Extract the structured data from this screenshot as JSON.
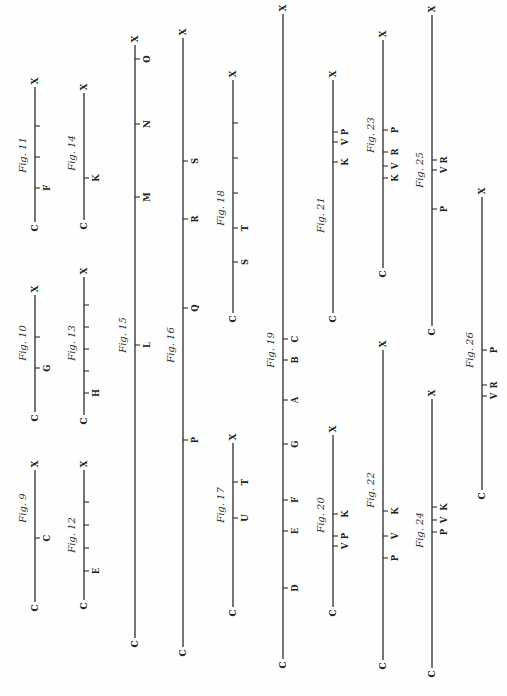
{
  "page": {
    "width": 507,
    "height": 696,
    "background": "#fefefe",
    "ink": "#2a2a2a",
    "orientation": "rotated 90° counter-clockwise; each figure is a line from C (bottom) to X (top)"
  },
  "figures": [
    {
      "id": "fig9",
      "caption": "Fig. 9",
      "x": 35,
      "top": 470,
      "bottom": 602,
      "start": "C",
      "end": "X",
      "caption_y": 508,
      "ticks": [
        {
          "y": 538,
          "label": "C"
        }
      ]
    },
    {
      "id": "fig10",
      "caption": "Fig. 10",
      "x": 35,
      "top": 295,
      "bottom": 412,
      "start": "C",
      "end": "X",
      "caption_y": 343,
      "ticks": [
        {
          "y": 337,
          "label": ""
        },
        {
          "y": 368,
          "label": "G"
        }
      ]
    },
    {
      "id": "fig11",
      "caption": "Fig. 11",
      "x": 35,
      "top": 87,
      "bottom": 222,
      "start": "C",
      "end": "X",
      "caption_y": 155,
      "ticks": [
        {
          "y": 126,
          "label": ""
        },
        {
          "y": 157,
          "label": ""
        },
        {
          "y": 188,
          "label": "F"
        }
      ]
    },
    {
      "id": "fig12",
      "caption": "Fig. 12",
      "x": 84,
      "top": 470,
      "bottom": 600,
      "start": "C",
      "end": "X",
      "caption_y": 535,
      "ticks": [
        {
          "y": 502,
          "label": ""
        },
        {
          "y": 525,
          "label": ""
        },
        {
          "y": 548,
          "label": ""
        },
        {
          "y": 571,
          "label": "E"
        }
      ]
    },
    {
      "id": "fig13",
      "caption": "Fig. 13",
      "x": 84,
      "top": 277,
      "bottom": 415,
      "start": "C",
      "end": "X",
      "caption_y": 343,
      "ticks": [
        {
          "y": 305,
          "label": ""
        },
        {
          "y": 327,
          "label": ""
        },
        {
          "y": 349,
          "label": ""
        },
        {
          "y": 371,
          "label": ""
        },
        {
          "y": 393,
          "label": "H"
        }
      ]
    },
    {
      "id": "fig14",
      "caption": "Fig. 14",
      "x": 84,
      "top": 93,
      "bottom": 220,
      "start": "C",
      "end": "X",
      "caption_y": 153,
      "ticks": [
        {
          "y": 178,
          "label": "K"
        }
      ]
    },
    {
      "id": "fig15",
      "caption": "Fig. 15",
      "x": 135,
      "top": 45,
      "bottom": 638,
      "start": "C",
      "end": "X",
      "caption_y": 335,
      "ticks": [
        {
          "y": 59,
          "label": "O"
        },
        {
          "y": 124,
          "label": "N"
        },
        {
          "y": 197,
          "label": "M"
        },
        {
          "y": 345,
          "label": "L"
        }
      ]
    },
    {
      "id": "fig16",
      "caption": "Fig. 16",
      "x": 183,
      "top": 38,
      "bottom": 647,
      "start": "C",
      "end": "X",
      "caption_y": 345,
      "ticks": [
        {
          "y": 161,
          "label": "S"
        },
        {
          "y": 219,
          "label": "R"
        },
        {
          "y": 308,
          "label": "Q"
        },
        {
          "y": 440,
          "label": "P"
        }
      ]
    },
    {
      "id": "fig17",
      "caption": "Fig. 17",
      "x": 233,
      "top": 443,
      "bottom": 607,
      "start": "C",
      "end": "X",
      "caption_y": 505,
      "ticks": [
        {
          "y": 482,
          "label": "T"
        },
        {
          "y": 518,
          "label": "U"
        }
      ]
    },
    {
      "id": "fig18",
      "caption": "Fig. 18",
      "x": 233,
      "top": 80,
      "bottom": 313,
      "start": "C",
      "end": "X",
      "caption_y": 208,
      "ticks": [
        {
          "y": 123,
          "label": ""
        },
        {
          "y": 158,
          "label": ""
        },
        {
          "y": 193,
          "label": ""
        },
        {
          "y": 228,
          "label": "T"
        },
        {
          "y": 262,
          "label": "S"
        }
      ]
    },
    {
      "id": "fig19",
      "caption": "Fig. 19",
      "x": 283,
      "top": 14,
      "bottom": 659,
      "start": "C",
      "end": "X",
      "caption_y": 350,
      "ticks": [
        {
          "y": 339,
          "label": "C"
        },
        {
          "y": 360,
          "label": "B"
        },
        {
          "y": 400,
          "label": "A"
        },
        {
          "y": 444,
          "label": "G"
        },
        {
          "y": 500,
          "label": "F"
        },
        {
          "y": 531,
          "label": "E"
        },
        {
          "y": 588,
          "label": "D"
        }
      ]
    },
    {
      "id": "fig20",
      "caption": "Fig. 20",
      "x": 333,
      "top": 435,
      "bottom": 607,
      "start": "C",
      "end": "X",
      "caption_y": 515,
      "ticks": [
        {
          "y": 514,
          "label": "K"
        },
        {
          "y": 536,
          "label": "P"
        },
        {
          "y": 546,
          "label": "V"
        }
      ]
    },
    {
      "id": "fig21",
      "caption": "Fig. 21",
      "x": 333,
      "top": 80,
      "bottom": 313,
      "start": "C",
      "end": "X",
      "caption_y": 215,
      "ticks": [
        {
          "y": 132,
          "label": "P"
        },
        {
          "y": 142,
          "label": "V"
        },
        {
          "y": 162,
          "label": "K"
        }
      ]
    },
    {
      "id": "fig22",
      "caption": "Fig. 22",
      "x": 383,
      "top": 350,
      "bottom": 660,
      "start": "C",
      "end": "X",
      "caption_y": 490,
      "ticks": [
        {
          "y": 511,
          "label": "K"
        },
        {
          "y": 536,
          "label": "V"
        },
        {
          "y": 558,
          "label": "P"
        }
      ]
    },
    {
      "id": "fig23",
      "caption": "Fig. 23",
      "x": 383,
      "top": 40,
      "bottom": 268,
      "start": "C",
      "end": "X",
      "caption_y": 135,
      "ticks": [
        {
          "y": 130,
          "label": "P"
        },
        {
          "y": 152,
          "label": "R"
        },
        {
          "y": 166,
          "label": "V"
        },
        {
          "y": 178,
          "label": "K"
        }
      ]
    },
    {
      "id": "fig24",
      "caption": "Fig. 24",
      "x": 432,
      "top": 399,
      "bottom": 668,
      "start": "C",
      "end": "X",
      "caption_y": 530,
      "ticks": [
        {
          "y": 507,
          "label": "K"
        },
        {
          "y": 520,
          "label": "V"
        },
        {
          "y": 532,
          "label": "P"
        }
      ]
    },
    {
      "id": "fig25",
      "caption": "Fig. 25",
      "x": 432,
      "top": 15,
      "bottom": 326,
      "start": "C",
      "end": "X",
      "caption_y": 170,
      "ticks": [
        {
          "y": 160,
          "label": "R"
        },
        {
          "y": 170,
          "label": "V"
        },
        {
          "y": 209,
          "label": "P"
        }
      ]
    },
    {
      "id": "fig26",
      "caption": "Fig. 26",
      "x": 482,
      "top": 197,
      "bottom": 490,
      "start": "C",
      "end": "X",
      "caption_y": 350,
      "ticks": [
        {
          "y": 350,
          "label": "P"
        },
        {
          "y": 385,
          "label": "R"
        },
        {
          "y": 396,
          "label": "V"
        }
      ]
    }
  ]
}
